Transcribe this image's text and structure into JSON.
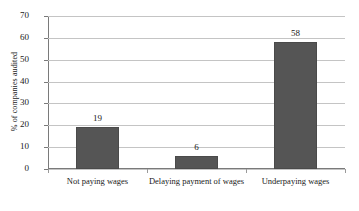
{
  "chart_data": {
    "type": "bar",
    "title": "",
    "xlabel": "",
    "ylabel": "% of companies audited",
    "categories": [
      "Not paying wages",
      "Delaying payment of wages",
      "Underpaying wages"
    ],
    "values": [
      19,
      6,
      58
    ],
    "value_labels": [
      "19",
      "6",
      "58"
    ],
    "ylim": [
      0,
      70
    ],
    "yticks": [
      "0",
      "10",
      "20",
      "30",
      "40",
      "50",
      "60",
      "70"
    ],
    "grid": true,
    "legend": "none",
    "bar_color": "#555555",
    "gridline_color": "#c4c4c4",
    "axis_color": "#7a7a7a"
  }
}
